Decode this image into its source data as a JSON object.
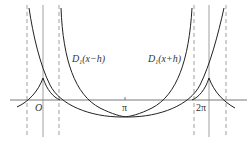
{
  "figure": {
    "curve_labels": {
      "left": {
        "main": "D",
        "sub": "1",
        "arg": "(x−h)"
      },
      "right": {
        "main": "D",
        "sub": "1",
        "arg": "(x+h)"
      }
    },
    "axis_labels": {
      "origin": "O",
      "pi": "π",
      "two_pi": "2π"
    },
    "colors": {
      "curve": "#222222",
      "axis": "#555555",
      "dashed": "#888888",
      "solid_vertical": "#888888"
    }
  }
}
